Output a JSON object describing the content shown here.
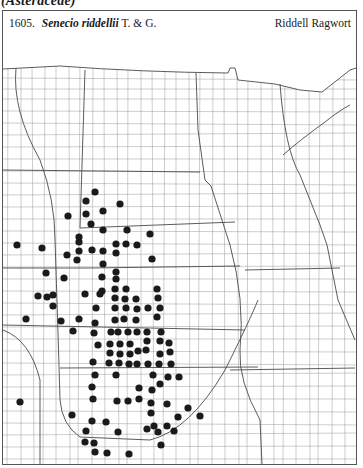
{
  "page": {
    "family_label": "(Asteraceae)",
    "species": {
      "number": "1605.",
      "scientific_name": "Senecio riddellii",
      "authority": "T. & G.",
      "common_name": "Riddell Ragwort"
    }
  },
  "map": {
    "region": "Great Plains county outline map",
    "dot_color": "#1a1a1a",
    "line_color": "#8a8a8a",
    "state_line_color": "#444444",
    "dots": [
      [
        95,
        192
      ],
      [
        86,
        201
      ],
      [
        120,
        204
      ],
      [
        68,
        216
      ],
      [
        86,
        214
      ],
      [
        103,
        211
      ],
      [
        91,
        224
      ],
      [
        127,
        230
      ],
      [
        79,
        237
      ],
      [
        103,
        230
      ],
      [
        17,
        245
      ],
      [
        42,
        248
      ],
      [
        67,
        255
      ],
      [
        79,
        242
      ],
      [
        79,
        251
      ],
      [
        77,
        260
      ],
      [
        92,
        250
      ],
      [
        103,
        251
      ],
      [
        116,
        244
      ],
      [
        126,
        244
      ],
      [
        137,
        245
      ],
      [
        150,
        234
      ],
      [
        116,
        253
      ],
      [
        152,
        259
      ],
      [
        103,
        264
      ],
      [
        46,
        273
      ],
      [
        64,
        278
      ],
      [
        102,
        277
      ],
      [
        116,
        272
      ],
      [
        116,
        279
      ],
      [
        102,
        291
      ],
      [
        115,
        289
      ],
      [
        126,
        289
      ],
      [
        157,
        289
      ],
      [
        38,
        296
      ],
      [
        47,
        297
      ],
      [
        53,
        295
      ],
      [
        53,
        306
      ],
      [
        85,
        294
      ],
      [
        100,
        294
      ],
      [
        26,
        319
      ],
      [
        61,
        321
      ],
      [
        79,
        319
      ],
      [
        73,
        331
      ],
      [
        96,
        308
      ],
      [
        95,
        323
      ],
      [
        94,
        333
      ],
      [
        98,
        345
      ],
      [
        93,
        362
      ],
      [
        115,
        298
      ],
      [
        125,
        299
      ],
      [
        136,
        299
      ],
      [
        115,
        308
      ],
      [
        126,
        308
      ],
      [
        137,
        309
      ],
      [
        148,
        308
      ],
      [
        160,
        308
      ],
      [
        115,
        320
      ],
      [
        124,
        319
      ],
      [
        136,
        320
      ],
      [
        158,
        298
      ],
      [
        157,
        317
      ],
      [
        111,
        332
      ],
      [
        118,
        332
      ],
      [
        128,
        332
      ],
      [
        137,
        332
      ],
      [
        147,
        332
      ],
      [
        161,
        332
      ],
      [
        110,
        344
      ],
      [
        120,
        344
      ],
      [
        130,
        344
      ],
      [
        147,
        341
      ],
      [
        160,
        341
      ],
      [
        169,
        343
      ],
      [
        110,
        353
      ],
      [
        120,
        354
      ],
      [
        130,
        354
      ],
      [
        138,
        351
      ],
      [
        146,
        350
      ],
      [
        160,
        354
      ],
      [
        170,
        352
      ],
      [
        109,
        363
      ],
      [
        119,
        363
      ],
      [
        129,
        364
      ],
      [
        137,
        364
      ],
      [
        148,
        364
      ],
      [
        159,
        364
      ],
      [
        171,
        364
      ],
      [
        95,
        375
      ],
      [
        116,
        375
      ],
      [
        153,
        375
      ],
      [
        168,
        377
      ],
      [
        179,
        377
      ],
      [
        160,
        384
      ],
      [
        92,
        387
      ],
      [
        139,
        388
      ],
      [
        152,
        390
      ],
      [
        20,
        402
      ],
      [
        93,
        399
      ],
      [
        117,
        401
      ],
      [
        128,
        401
      ],
      [
        139,
        399
      ],
      [
        151,
        403
      ],
      [
        167,
        404
      ],
      [
        188,
        408
      ],
      [
        72,
        415
      ],
      [
        151,
        413
      ],
      [
        178,
        417
      ],
      [
        200,
        416
      ],
      [
        92,
        421
      ],
      [
        106,
        422
      ],
      [
        86,
        431
      ],
      [
        118,
        432
      ],
      [
        147,
        429
      ],
      [
        154,
        426
      ],
      [
        167,
        426
      ],
      [
        158,
        432
      ],
      [
        174,
        431
      ],
      [
        85,
        442
      ],
      [
        94,
        443
      ],
      [
        161,
        445
      ],
      [
        95,
        452
      ],
      [
        107,
        453
      ],
      [
        129,
        454
      ]
    ]
  }
}
